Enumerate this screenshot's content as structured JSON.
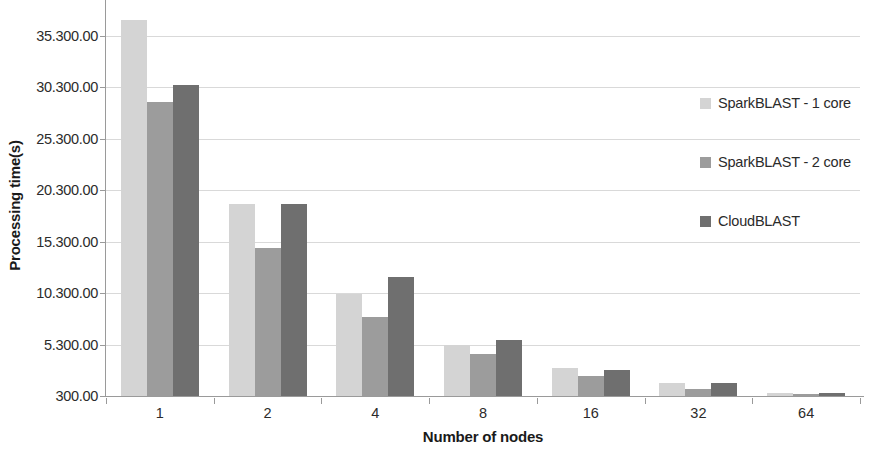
{
  "chart_data": {
    "type": "bar",
    "title": "",
    "xlabel": "Number of nodes",
    "ylabel": "Processing time(s)",
    "categories": [
      "1",
      "2",
      "4",
      "8",
      "16",
      "32",
      "64"
    ],
    "series": [
      {
        "name": "SparkBLAST - 1 core",
        "color": "#d4d4d4",
        "values": [
          36800,
          19000,
          10200,
          5300,
          3000,
          1600,
          600
        ]
      },
      {
        "name": "SparkBLAST - 2 core",
        "color": "#9c9c9c",
        "values": [
          28900,
          14700,
          8000,
          4400,
          2200,
          1000,
          500
        ]
      },
      {
        "name": "CloudBLAST",
        "color": "#6f6f6f",
        "values": [
          30500,
          19000,
          11900,
          5700,
          2800,
          1600,
          600
        ]
      }
    ],
    "ylim": [
      300,
      38000
    ],
    "ytick_values": [
      300,
      5300,
      10300,
      15300,
      20300,
      25300,
      30300,
      35300
    ],
    "ytick_labels": [
      "300.00",
      "5.300.00",
      "10.300.00",
      "15.300.00",
      "20.300.00",
      "25.300.00",
      "30.300.00",
      "35.300.00"
    ],
    "grid": true,
    "legend_position": "right"
  },
  "legend": {
    "items": [
      {
        "label": "SparkBLAST - 1 core",
        "color": "#d4d4d4"
      },
      {
        "label": "SparkBLAST - 2 core",
        "color": "#9c9c9c"
      },
      {
        "label": "CloudBLAST",
        "color": "#6f6f6f"
      }
    ]
  },
  "axes": {
    "y_title": "Processing time(s)",
    "x_title": "Number of nodes"
  }
}
